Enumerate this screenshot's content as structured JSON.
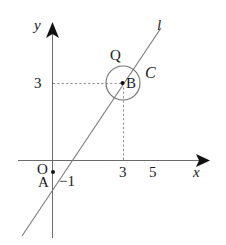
{
  "figure": {
    "kind": "coordinate-plane-geometry-diagram",
    "background_color": "#ffffff",
    "stroke_color": "#555555",
    "text_color": "#1a1a1a"
  },
  "axes": {
    "x_axis_label": "x",
    "y_axis_label": "y",
    "origin_label": "O",
    "x_ticks": [
      {
        "label": "3",
        "value": 3
      },
      {
        "label": "5",
        "value": 5
      }
    ],
    "y_ticks": [
      {
        "label": "3",
        "value": 3
      }
    ],
    "negative_y_label": "−1"
  },
  "points": {
    "a": {
      "label": "A",
      "value_label": "−1",
      "x": 0,
      "y": -1
    },
    "b": {
      "label": "B",
      "x": 3,
      "y": 3
    },
    "q": {
      "label": "Q"
    }
  },
  "circle": {
    "label": "C",
    "center_point": "B",
    "center_x": 3,
    "center_y": 3,
    "radius": 0.65
  },
  "line": {
    "label": "l"
  },
  "guides": {
    "horizontal_dashed_from": "y-axis at 3",
    "vertical_dashed_from": "x-axis at 3"
  }
}
